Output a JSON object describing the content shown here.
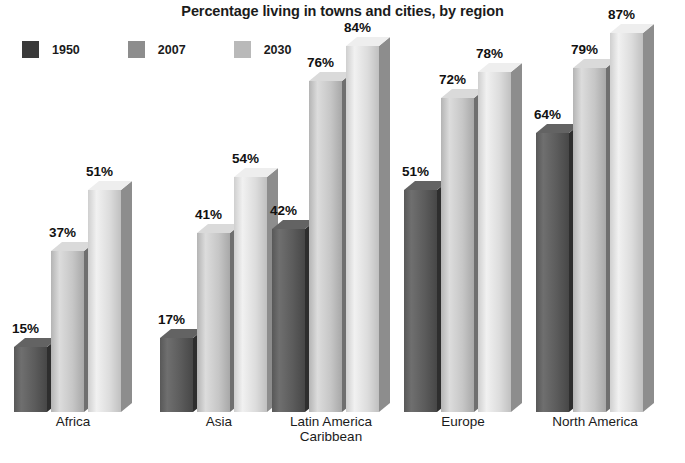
{
  "chart_data": {
    "type": "bar",
    "title": "Percentage living in towns and cities, by region",
    "xlabel": "",
    "ylabel": "",
    "ylim": [
      0,
      100
    ],
    "grid": false,
    "legend_position": "top-left",
    "value_suffix": "%",
    "categories": [
      "Africa",
      "Asia",
      "Latin America\nCaribbean",
      "Europe",
      "North America"
    ],
    "series": [
      {
        "name": "1950",
        "color": "#4a4a4a",
        "values": [
          15,
          17,
          42,
          51,
          64
        ],
        "labels": [
          "15%",
          "17%",
          "42%",
          "51%",
          "64%"
        ]
      },
      {
        "name": "2007",
        "color": "#b9b9b9",
        "values": [
          37,
          41,
          76,
          72,
          79
        ],
        "labels": [
          "37%",
          "41%",
          "76%",
          "72%",
          "79%"
        ]
      },
      {
        "name": "2030",
        "color": "#d2d2d2",
        "values": [
          51,
          54,
          84,
          78,
          87
        ],
        "labels": [
          "51%",
          "54%",
          "84%",
          "78%",
          "87%"
        ]
      }
    ]
  },
  "legend": {
    "items": [
      {
        "label": "1950",
        "swatch_color": "#3a3a3a"
      },
      {
        "label": "2007",
        "swatch_color": "#8d8d8d"
      },
      {
        "label": "2030",
        "swatch_color": "#b9b9b9"
      }
    ]
  },
  "groups": [
    {
      "label": "Africa",
      "bars": [
        {
          "series": "1950",
          "value": 15,
          "label": "15%"
        },
        {
          "series": "2007",
          "value": 37,
          "label": "37%"
        },
        {
          "series": "2030",
          "value": 51,
          "label": "51%"
        }
      ]
    },
    {
      "label": "Asia",
      "bars": [
        {
          "series": "1950",
          "value": 17,
          "label": "17%"
        },
        {
          "series": "2007",
          "value": 41,
          "label": "41%"
        },
        {
          "series": "2030",
          "value": 54,
          "label": "54%"
        }
      ]
    },
    {
      "label": "Latin America\nCaribbean",
      "bars": [
        {
          "series": "1950",
          "value": 42,
          "label": "42%"
        },
        {
          "series": "2007",
          "value": 76,
          "label": "76%"
        },
        {
          "series": "2030",
          "value": 84,
          "label": "84%"
        }
      ]
    },
    {
      "label": "Europe",
      "bars": [
        {
          "series": "1950",
          "value": 51,
          "label": "51%"
        },
        {
          "series": "2007",
          "value": 72,
          "label": "72%"
        },
        {
          "series": "2030",
          "value": 78,
          "label": "78%"
        }
      ]
    },
    {
      "label": "North America",
      "bars": [
        {
          "series": "1950",
          "value": 64,
          "label": "64%"
        },
        {
          "series": "2007",
          "value": 79,
          "label": "79%"
        },
        {
          "series": "2030",
          "value": 87,
          "label": "87%"
        }
      ]
    }
  ],
  "layout": {
    "baseline_y": 412,
    "px_per_percent": 4.36,
    "bar_width": 33,
    "bar_depth": 11,
    "group_x": [
      14,
      160,
      272,
      404,
      536
    ],
    "bar_pitch": 37
  },
  "colors": {
    "background": "#ffffff",
    "text": "#1b1b1b",
    "series_1950_light": "#6e6e6e",
    "series_1950_dark": "#3a3a3a",
    "series_2007_light": "#d8d8d8",
    "series_2007_dark": "#8f8f8f",
    "series_2030_light": "#ececec",
    "series_2030_dark": "#a9a9a9"
  }
}
